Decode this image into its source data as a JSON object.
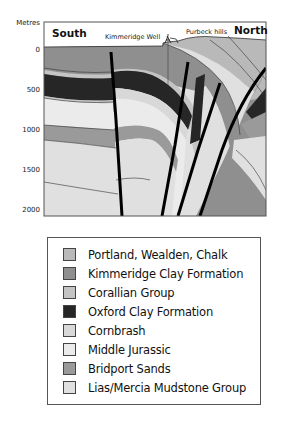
{
  "diagram": {
    "axis_title": "Metres",
    "depth_ticks": [
      {
        "label": "0",
        "y": 51
      },
      {
        "label": "500",
        "y": 91
      },
      {
        "label": "1000",
        "y": 131
      },
      {
        "label": "1500",
        "y": 171
      },
      {
        "label": "2000",
        "y": 211
      }
    ],
    "labels": {
      "south": "South",
      "north": "North",
      "well": "Kimmeridge Well",
      "hills": "Purbeck hills"
    }
  },
  "legend": {
    "items": [
      {
        "label": "Portland, Wealden, Chalk",
        "color": "#b9b9b9"
      },
      {
        "label": "Kimmeridge Clay Formation",
        "color": "#8f8f8f"
      },
      {
        "label": "Corallian Group",
        "color": "#c4c4c4"
      },
      {
        "label": "Oxford Clay Formation",
        "color": "#262626"
      },
      {
        "label": "Cornbrash",
        "color": "#d8d8d8"
      },
      {
        "label": "Middle Jurassic",
        "color": "#ebebeb"
      },
      {
        "label": "Bridport Sands",
        "color": "#9a9a9a"
      },
      {
        "label": "Lias/Mercia Mudstone Group",
        "color": "#e0e0e0"
      }
    ]
  }
}
